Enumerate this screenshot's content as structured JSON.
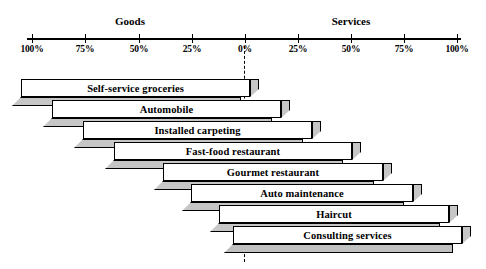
{
  "chart_data": {
    "type": "bar",
    "orientation": "horizontal-diverging",
    "title": "",
    "xlabel": "",
    "ylabel": "",
    "grid": false,
    "legend_position": "none",
    "axis": {
      "left_group": "Goods",
      "right_group": "Services",
      "tick_labels": [
        "100%",
        "75%",
        "50%",
        "25%",
        "0%",
        "25%",
        "50%",
        "75%",
        "100%"
      ],
      "tick_values": [
        -100,
        -75,
        -50,
        -25,
        0,
        25,
        50,
        75,
        100
      ],
      "xlim": [
        -100,
        100
      ],
      "zero_marker": "dashed-line"
    },
    "categories": [
      "Self-service groceries",
      "Automobile",
      "Installed carpeting",
      "Fast-food restaurant",
      "Gourmet restaurant",
      "Auto maintenance",
      "Haircut",
      "Consulting services"
    ],
    "series": [
      {
        "name": "Goods",
        "values": [
          100,
          85,
          73,
          60,
          48,
          35,
          20,
          8
        ]
      },
      {
        "name": "Services",
        "values": [
          3,
          15,
          26,
          42,
          54,
          66,
          80,
          93
        ]
      }
    ]
  },
  "chart": {
    "axis_labels": {
      "goods": "Goods",
      "services": "Services"
    },
    "ticks": [
      {
        "label": "100%",
        "x": 32
      },
      {
        "label": "75%",
        "x": 85
      },
      {
        "label": "50%",
        "x": 139
      },
      {
        "label": "25%",
        "x": 192
      },
      {
        "label": "0%",
        "x": 245
      },
      {
        "label": "25%",
        "x": 298
      },
      {
        "label": "50%",
        "x": 351
      },
      {
        "label": "75%",
        "x": 404
      },
      {
        "label": "100%",
        "x": 457
      }
    ],
    "bars": [
      {
        "label": "Self-service groceries",
        "left": 21,
        "width": 229,
        "top": 79
      },
      {
        "label": "Automobile",
        "left": 52,
        "width": 229,
        "top": 100
      },
      {
        "label": "Installed carpeting",
        "left": 83,
        "width": 229,
        "top": 121
      },
      {
        "label": "Fast-food restaurant",
        "left": 114,
        "width": 238,
        "top": 142
      },
      {
        "label": "Gourmet restaurant",
        "left": 163,
        "width": 220,
        "top": 163
      },
      {
        "label": "Auto maintenance",
        "left": 191,
        "width": 222,
        "top": 184
      },
      {
        "label": "Haircut",
        "left": 219,
        "width": 230,
        "top": 205
      },
      {
        "label": "Consulting services",
        "left": 233,
        "width": 229,
        "top": 226
      }
    ]
  }
}
